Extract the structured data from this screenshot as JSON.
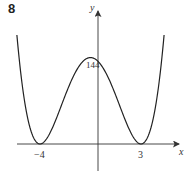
{
  "question_number": "8",
  "chart_data": {
    "type": "line",
    "title": "",
    "xlabel": "x",
    "ylabel": "y",
    "function": "y = (x + 4)^2 (x - 3)^2",
    "roots": [
      -4,
      3
    ],
    "y_intercept": 144,
    "x_tick_labels": [
      "-4",
      "3"
    ],
    "y_tick_labels": [
      "144"
    ],
    "xlim": [
      -5.6,
      4.6
    ],
    "grid": false,
    "legend": null,
    "points": [
      {
        "x": -5.6,
        "y": 189.3
      },
      {
        "x": -5,
        "y": 64
      },
      {
        "x": -4,
        "y": 0
      },
      {
        "x": -3,
        "y": 36
      },
      {
        "x": -2,
        "y": 100
      },
      {
        "x": -1,
        "y": 144
      },
      {
        "x": -0.5,
        "y": 150.06
      },
      {
        "x": 0,
        "y": 144
      },
      {
        "x": 1,
        "y": 100
      },
      {
        "x": 2,
        "y": 36
      },
      {
        "x": 3,
        "y": 0
      },
      {
        "x": 4,
        "y": 64
      },
      {
        "x": 4.6,
        "y": 189.3
      }
    ]
  },
  "labels": {
    "y_axis": "y",
    "x_axis": "x",
    "intercept": "144",
    "root_left": "−4",
    "root_right": "3"
  },
  "colors": {
    "curve": "#222222",
    "axes": "#333333"
  }
}
